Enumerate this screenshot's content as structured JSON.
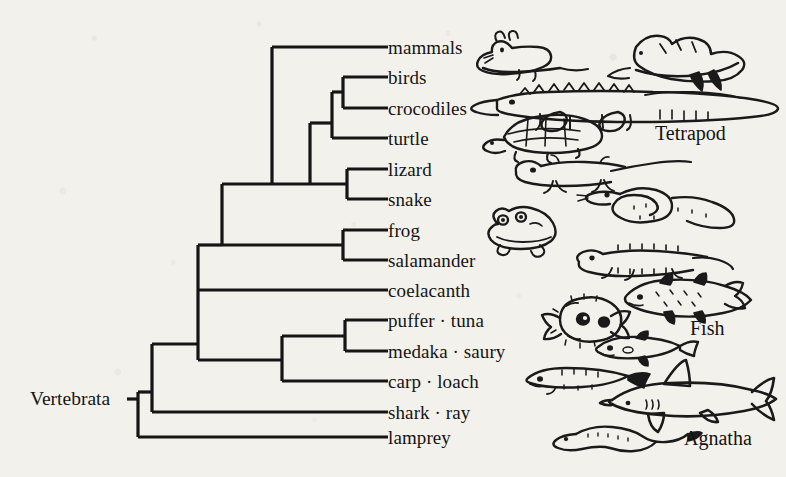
{
  "figure": {
    "type": "cladogram",
    "root_label": "Vertebrata",
    "background_color": "#f3f1ec",
    "ink_color": "#151515"
  },
  "tips": [
    {
      "id": "mammals",
      "label": "mammals",
      "y": 47,
      "branch_x": 310,
      "illustration": "mouse-drawing"
    },
    {
      "id": "birds",
      "label": "birds",
      "y": 77,
      "branch_x": 353,
      "illustration": "bird-drawing"
    },
    {
      "id": "crocodiles",
      "label": "crocodiles",
      "y": 108,
      "branch_x": 353,
      "illustration": "crocodile-drawing"
    },
    {
      "id": "turtle",
      "label": "turtle",
      "y": 138,
      "branch_x": 343,
      "illustration": "turtle-drawing"
    },
    {
      "id": "lizard",
      "label": "lizard",
      "y": 169,
      "branch_x": 369,
      "illustration": "lizard-drawing"
    },
    {
      "id": "snake",
      "label": "snake",
      "y": 199,
      "branch_x": 369,
      "illustration": "snake-drawing"
    },
    {
      "id": "frog",
      "label": "frog",
      "y": 230,
      "branch_x": 343,
      "illustration": "frog-drawing"
    },
    {
      "id": "salamander",
      "label": "salamander",
      "y": 260,
      "branch_x": 343,
      "illustration": "salamander-drawing"
    },
    {
      "id": "coelacanth",
      "label": "coelacanth",
      "y": 290,
      "branch_x": 198,
      "illustration": "coelacanth-drawing"
    },
    {
      "id": "puffer",
      "label": "puffer · tuna",
      "y": 320,
      "branch_x": 345,
      "illustration": "pufferfish-drawing"
    },
    {
      "id": "medaka",
      "label": "medaka · saury",
      "y": 351,
      "branch_x": 345,
      "illustration": "medaka-drawing"
    },
    {
      "id": "carp",
      "label": "carp · loach",
      "y": 381,
      "branch_x": 282,
      "illustration": "carp-drawing"
    },
    {
      "id": "shark",
      "label": "shark · ray",
      "y": 412,
      "branch_x": 152,
      "illustration": "shark-drawing"
    },
    {
      "id": "lamprey",
      "label": "lamprey",
      "y": 437,
      "branch_x": 138,
      "illustration": "lamprey-drawing"
    }
  ],
  "label_x": 388,
  "group_labels": [
    {
      "id": "tetrapod",
      "label": "Tetrapod",
      "x": 655,
      "y": 133
    },
    {
      "id": "fish",
      "label": "Fish",
      "x": 690,
      "y": 328
    },
    {
      "id": "agnatha",
      "label": "Agnatha",
      "x": 684,
      "y": 438
    }
  ],
  "nodes": [
    {
      "id": "root",
      "x": 138,
      "children_y": [
        412,
        437
      ],
      "name": "vertebrata-root"
    },
    {
      "id": "gnathostomata",
      "x": 152,
      "children_y": [
        290,
        412
      ],
      "name": "gnathostomata-node"
    },
    {
      "id": "osteichthyes",
      "x": 198,
      "children_y": [
        169,
        381
      ],
      "name": "osteichthyes-node"
    },
    {
      "id": "teleostomi",
      "x": 282,
      "children_y": [
        336,
        381
      ],
      "name": "teleost-node"
    },
    {
      "id": "acanthomorpha",
      "x": 345,
      "children_y": [
        320,
        351
      ],
      "name": "acanthomorpha-node"
    },
    {
      "id": "tetrapoda",
      "x": 222,
      "children_y": [
        138,
        245
      ],
      "name": "tetrapoda-node"
    },
    {
      "id": "amphibia",
      "x": 343,
      "children_y": [
        230,
        260
      ],
      "name": "amphibia-node"
    },
    {
      "id": "amniota",
      "x": 272,
      "children_y": [
        47,
        184
      ],
      "name": "amniota-node"
    },
    {
      "id": "reptilia",
      "x": 310,
      "children_y": [
        123,
        184
      ],
      "name": "reptilia-node"
    },
    {
      "id": "archosauria",
      "x": 332,
      "children_y": [
        92,
        138
      ],
      "name": "archosauria-node"
    },
    {
      "id": "crocbird",
      "x": 343,
      "children_y": [
        77,
        108
      ],
      "name": "bird-crocodile-node"
    },
    {
      "id": "squamata",
      "x": 347,
      "children_y": [
        169,
        199
      ],
      "name": "squamata-node"
    }
  ],
  "root_label_position": {
    "x": 30,
    "y": 399
  }
}
